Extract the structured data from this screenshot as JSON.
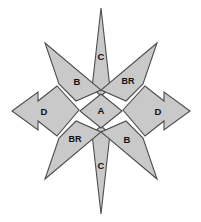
{
  "figure": {
    "name": "eight-pointed-star-diagram",
    "background_color": "#ffffff",
    "fill_color": "#c9c9c9",
    "stroke_color": "#4d4d4d",
    "label_color": "#111111"
  },
  "regions": [
    {
      "id": "center",
      "label": "A",
      "shape": "diamond",
      "position": "center",
      "cx": 101,
      "cy": 111
    },
    {
      "id": "spike-top",
      "label": "C",
      "shape": "narrow-spike",
      "position": "top",
      "cx": 101,
      "cy": 56
    },
    {
      "id": "spike-bottom",
      "label": "C",
      "shape": "narrow-spike",
      "position": "bottom",
      "cx": 101,
      "cy": 167
    },
    {
      "id": "spike-upper-left",
      "label": "B",
      "shape": "triangle-spike",
      "position": "upper-left",
      "cx": 77,
      "cy": 82
    },
    {
      "id": "spike-upper-right",
      "label": "BR",
      "shape": "triangle-spike",
      "position": "upper-right",
      "cx": 127,
      "cy": 82
    },
    {
      "id": "spike-lower-left",
      "label": "BR",
      "shape": "triangle-spike",
      "position": "lower-left",
      "cx": 76,
      "cy": 140
    },
    {
      "id": "spike-lower-right",
      "label": "B",
      "shape": "triangle-spike",
      "position": "lower-right",
      "cx": 127,
      "cy": 140
    },
    {
      "id": "arrow-left",
      "label": "D",
      "shape": "double-chevron-arrow",
      "position": "left",
      "cx": 45,
      "cy": 111
    },
    {
      "id": "arrow-right",
      "label": "D",
      "shape": "double-chevron-arrow",
      "position": "right",
      "cx": 158,
      "cy": 111
    }
  ],
  "geometry": {
    "paths": {
      "center": "M101,94 L122,111 L101,128 L80,111 Z",
      "spike_top": "M101,8 L110,88 L101,96 L92,88 Z",
      "spike_bottom": "M101,214 L92,134 L101,126 L110,134 Z",
      "spike_upper_left": "M45,43 L101,90 L76,101 L59,84 Z",
      "spike_upper_right": "M157,43 L101,90 L126,101 L143,84 Z",
      "spike_lower_left": "M45,179 L101,132 L76,121 L59,138 Z",
      "spike_lower_right": "M157,179 L101,132 L126,121 L143,138 Z",
      "arrow_left": "M12,111 L38,92 L38,101 L57,86 L79,110 L57,136 L38,121 L38,130 Z",
      "arrow_right": "M190,111 L164,92 L164,101 L145,86 L123,110 L145,136 L164,121 L164,130 Z"
    }
  }
}
